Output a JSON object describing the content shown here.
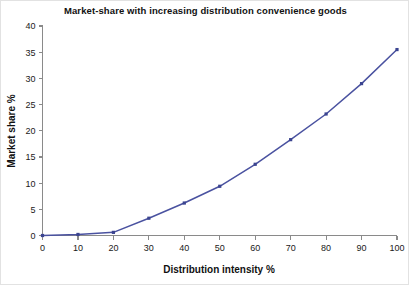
{
  "chart_data": {
    "type": "line",
    "title": "Market-share with increasing distribution convenience goods",
    "xlabel": "Distribution intensity %",
    "ylabel": "Market share %",
    "xlim": [
      0,
      100
    ],
    "ylim": [
      0,
      40
    ],
    "xticks": [
      0,
      10,
      20,
      30,
      40,
      50,
      60,
      70,
      80,
      90,
      100
    ],
    "xtick_labels": [
      "0",
      "10",
      "20",
      "30",
      "40",
      "50",
      "60",
      "70",
      "80",
      "90",
      "100"
    ],
    "yticks": [
      0,
      5,
      10,
      15,
      20,
      25,
      30,
      35,
      40
    ],
    "ytick_labels": [
      "0",
      "5",
      "10",
      "15",
      "20",
      "25",
      "30",
      "35",
      "40"
    ],
    "grid": false,
    "legend": false,
    "legend_position": "none",
    "line_color": "#4a52a0",
    "marker_color": "#3b4490",
    "marker_shape": "square",
    "x": [
      0,
      10,
      20,
      30,
      40,
      50,
      60,
      70,
      80,
      90,
      100
    ],
    "values": [
      0,
      0.2,
      0.6,
      3.3,
      6.2,
      9.4,
      13.6,
      18.3,
      23.2,
      29.0,
      35.5
    ],
    "series": [
      {
        "name": "Market share %",
        "x": [
          0,
          10,
          20,
          30,
          40,
          50,
          60,
          70,
          80,
          90,
          100
        ],
        "values": [
          0,
          0.2,
          0.6,
          3.3,
          6.2,
          9.4,
          13.6,
          18.3,
          23.2,
          29.0,
          35.5
        ]
      }
    ]
  }
}
